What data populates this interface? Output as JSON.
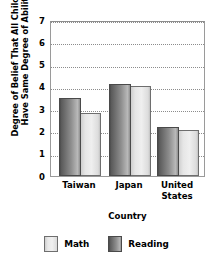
{
  "chart_data": {
    "type": "bar",
    "title": "",
    "xlabel": "Country",
    "ylabel": "Degree of Belief That All Children Have Same Degree of Ability",
    "ylabel_lines": [
      "Degree of Belief That All Children",
      "Have Same Degree of Ability"
    ],
    "categories": [
      "Taiwan",
      "Japan",
      "United States"
    ],
    "category_lines": [
      [
        "Taiwan"
      ],
      [
        "Japan"
      ],
      [
        "United",
        "States"
      ]
    ],
    "series": [
      {
        "name": "Reading",
        "values": [
          3.55,
          4.2,
          2.25
        ],
        "color": "#8d8d8d"
      },
      {
        "name": "Math",
        "values": [
          2.85,
          4.1,
          2.1
        ],
        "color": "#ededed"
      }
    ],
    "ylim": [
      0,
      7
    ],
    "yticks": [
      0,
      1,
      2,
      3,
      4,
      5,
      6,
      7
    ],
    "ytick_labels": [
      "0",
      "1",
      "2",
      "3",
      "4",
      "5",
      "6",
      "7"
    ],
    "grid": true,
    "grid_style": "dotted",
    "legend_position": "bottom",
    "legend": [
      {
        "label": "Math",
        "swatch": "math"
      },
      {
        "label": "Reading",
        "swatch": "reading"
      }
    ]
  }
}
